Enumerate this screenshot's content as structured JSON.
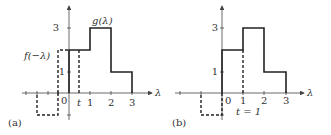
{
  "panels": [
    {
      "id": "a",
      "caption": "(a)",
      "x_label": "λ",
      "y_ticks": [
        "3",
        "1"
      ],
      "x_ticks": [
        "0",
        "t",
        "1",
        "2",
        "3"
      ],
      "curve_labels": {
        "g": "g(λ)",
        "f": "f(−λ)"
      }
    },
    {
      "id": "b",
      "caption": "(b)",
      "x_label": "λ",
      "y_ticks": [
        "3",
        "1"
      ],
      "x_ticks": [
        "0",
        "1",
        "2",
        "3"
      ],
      "t_label": "t = 1"
    }
  ],
  "colors": {
    "stroke": "#222222",
    "text": "#333333"
  }
}
